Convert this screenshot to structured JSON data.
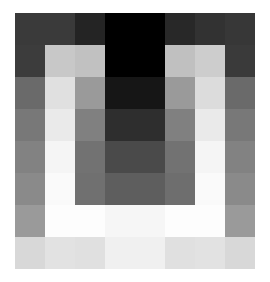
{
  "figure": {
    "type": "pixelated-grayscale-image",
    "background_color": "#ffffff",
    "rows": 8,
    "columns": 8
  },
  "chart_data": {
    "type": "heatmap",
    "title": "",
    "subtitle": "",
    "xlabel": "",
    "ylabel": "",
    "colormap": "gray",
    "grid": false,
    "legend": "none",
    "x": [
      0,
      1,
      2,
      3,
      4,
      5,
      6,
      7
    ],
    "y": [
      0,
      1,
      2,
      3,
      4,
      5,
      6,
      7
    ],
    "xlim": [
      0,
      8
    ],
    "ylim": [
      0,
      8
    ],
    "value_range": [
      0,
      255
    ],
    "values": [
      [
        58,
        58,
        36,
        0,
        0,
        40,
        50,
        55
      ],
      [
        60,
        200,
        193,
        0,
        0,
        192,
        205,
        58
      ],
      [
        106,
        224,
        154,
        22,
        22,
        154,
        220,
        106
      ],
      [
        120,
        234,
        128,
        46,
        46,
        128,
        234,
        120
      ],
      [
        130,
        245,
        114,
        74,
        74,
        114,
        245,
        130
      ],
      [
        138,
        250,
        112,
        94,
        94,
        110,
        250,
        138
      ],
      [
        154,
        253,
        253,
        246,
        246,
        253,
        253,
        154
      ],
      [
        216,
        226,
        224,
        240,
        240,
        224,
        226,
        216
      ]
    ],
    "colors": [
      [
        "#3a3a3a",
        "#3a3a3a",
        "#242424",
        "#000000",
        "#000000",
        "#282828",
        "#323232",
        "#373737"
      ],
      [
        "#3c3c3c",
        "#c8c8c8",
        "#c1c1c1",
        "#000000",
        "#000000",
        "#c0c0c0",
        "#cdcdcd",
        "#3a3a3a"
      ],
      [
        "#6a6a6a",
        "#e0e0e0",
        "#9a9a9a",
        "#161616",
        "#161616",
        "#9a9a9a",
        "#dcdcdc",
        "#6a6a6a"
      ],
      [
        "#787878",
        "#eaeaea",
        "#808080",
        "#2e2e2e",
        "#2e2e2e",
        "#808080",
        "#eaeaea",
        "#787878"
      ],
      [
        "#828282",
        "#f5f5f5",
        "#727272",
        "#4a4a4a",
        "#4a4a4a",
        "#727272",
        "#f5f5f5",
        "#828282"
      ],
      [
        "#8a8a8a",
        "#fafafa",
        "#707070",
        "#5e5e5e",
        "#5e5e5e",
        "#6e6e6e",
        "#fafafa",
        "#8a8a8a"
      ],
      [
        "#9a9a9a",
        "#fdfdfd",
        "#fdfdfd",
        "#f6f6f6",
        "#f6f6f6",
        "#fdfdfd",
        "#fdfdfd",
        "#9a9a9a"
      ],
      [
        "#d8d8d8",
        "#e2e2e2",
        "#e0e0e0",
        "#f0f0f0",
        "#f0f0f0",
        "#e0e0e0",
        "#e2e2e2",
        "#d8d8d8"
      ]
    ]
  }
}
